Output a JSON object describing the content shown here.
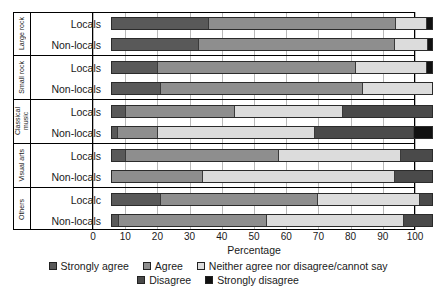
{
  "chart_data": {
    "type": "bar",
    "orientation": "horizontal",
    "stacked": true,
    "title": "",
    "xlabel": "Percentage",
    "ylabel": "",
    "xlim": [
      0,
      100
    ],
    "xticks": [
      0,
      10,
      20,
      30,
      40,
      50,
      60,
      70,
      80,
      90,
      100
    ],
    "grid": true,
    "legend_position": "bottom",
    "series": [
      {
        "name": "Strongly agree",
        "color": "#595959"
      },
      {
        "name": "Agree",
        "color": "#8e8e8e"
      },
      {
        "name": "Neither agree nor disagree/cannot say",
        "color": "#dcdcdc"
      },
      {
        "name": "Disagree",
        "color": "#4a4a4a"
      },
      {
        "name": "Strongly disagree",
        "color": "#111111"
      }
    ],
    "groups": [
      {
        "label": "Large rock",
        "rows": [
          {
            "category": "Locals",
            "values": [
              30.0,
              58.5,
              9.5,
              0.0,
              2.0
            ]
          },
          {
            "category": "Non-locals",
            "values": [
              27.0,
              61.0,
              10.5,
              0.0,
              1.5
            ]
          }
        ]
      },
      {
        "label": "Small rock",
        "rows": [
          {
            "category": "Locals",
            "values": [
              14.0,
              62.0,
              22.0,
              0.0,
              2.0
            ]
          },
          {
            "category": "Non-locals",
            "values": [
              15.0,
              63.0,
              22.0,
              0.0,
              0.0
            ]
          }
        ]
      },
      {
        "label": "Classical\nmusic",
        "rows": [
          {
            "category": "Locals",
            "values": [
              4.0,
              34.0,
              34.0,
              28.0,
              0.0
            ]
          },
          {
            "category": "Non-locals",
            "values": [
              1.5,
              12.5,
              49.0,
              31.0,
              6.0
            ]
          }
        ]
      },
      {
        "label": "Visual arts",
        "rows": [
          {
            "category": "Locals",
            "values": [
              4.0,
              48.0,
              38.0,
              10.0,
              0.0
            ]
          },
          {
            "category": "Non-locals",
            "values": [
              0.0,
              28.0,
              60.0,
              12.0,
              0.0
            ]
          }
        ]
      },
      {
        "label": "Others",
        "rows": [
          {
            "category": "Localc",
            "values": [
              15.0,
              49.0,
              32.0,
              4.0,
              0.0
            ]
          },
          {
            "category": "Non-locals",
            "values": [
              2.0,
              46.0,
              43.0,
              9.0,
              0.0
            ]
          }
        ]
      }
    ]
  }
}
